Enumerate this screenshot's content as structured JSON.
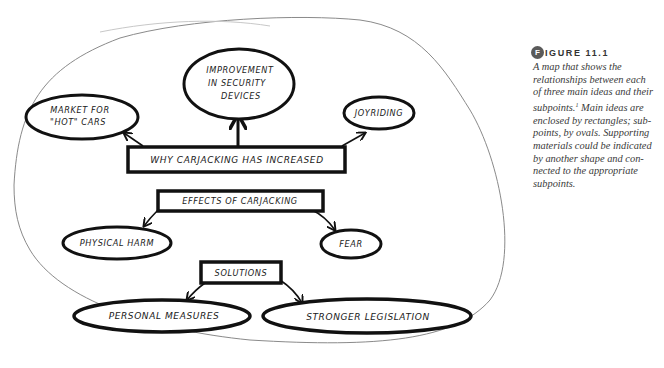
{
  "figure": {
    "badge_letter": "F",
    "label": "IGURE 11.1",
    "caption_lines": [
      "A map that shows the",
      "relationships between each",
      "of three main ideas and their",
      "subpoints.",
      " Main ideas are",
      "enclosed by rectangles; sub-",
      "points, by ovals. Supporting",
      "materials could be indicated",
      "by another shape and con-",
      "nected to the appropriate",
      "subpoints."
    ],
    "footnote_marker": "1",
    "badge_color": "#5a5a5a"
  },
  "map": {
    "main_ideas": [
      {
        "label": "WHY CARJACKING HAS INCREASED",
        "subpoints": [
          "MARKET FOR \"HOT\" CARS",
          "IMPROVEMENT IN SECURITY DEVICES",
          "JOYRIDING"
        ]
      },
      {
        "label": "EFFECTS OF CARJACKING",
        "subpoints": [
          "PHYSICAL HARM",
          "FEAR"
        ]
      },
      {
        "label": "SOLUTIONS",
        "subpoints": [
          "PERSONAL MEASURES",
          "STRONGER LEGISLATION"
        ]
      }
    ],
    "subpoint_lines": {
      "market_1": "MARKET FOR",
      "market_2": "\"HOT\" CARS",
      "improve_1": "IMPROVEMENT",
      "improve_2": "IN SECURITY",
      "improve_3": "DEVICES"
    }
  }
}
